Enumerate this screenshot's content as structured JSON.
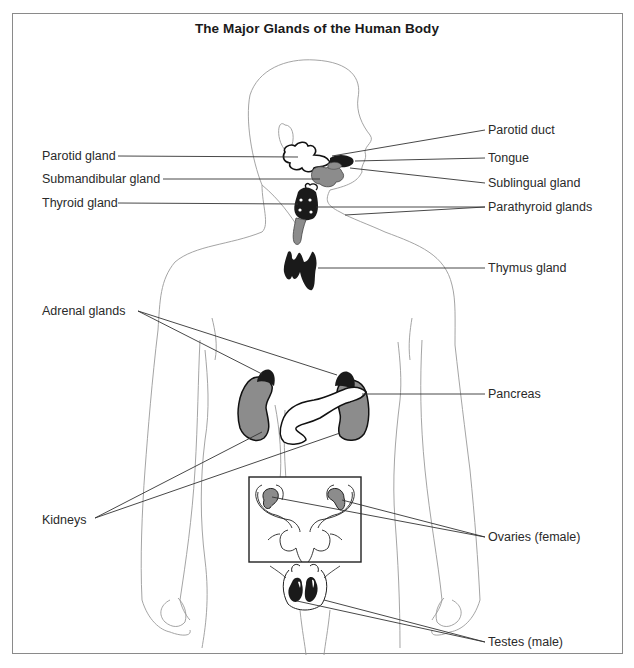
{
  "title": "The Major Glands of the Human Body",
  "labels": {
    "left": [
      {
        "id": "parotid-gland",
        "text": "Parotid gland",
        "x": 42,
        "y": 149
      },
      {
        "id": "submandibular-gland",
        "text": "Submandibular gland",
        "x": 42,
        "y": 172
      },
      {
        "id": "thyroid-gland",
        "text": "Thyroid gland",
        "x": 42,
        "y": 196
      },
      {
        "id": "adrenal-glands",
        "text": "Adrenal glands",
        "x": 42,
        "y": 304
      },
      {
        "id": "kidneys",
        "text": "Kidneys",
        "x": 42,
        "y": 513
      }
    ],
    "right": [
      {
        "id": "parotid-duct",
        "text": "Parotid duct",
        "x": 488,
        "y": 123
      },
      {
        "id": "tongue",
        "text": "Tongue",
        "x": 488,
        "y": 151
      },
      {
        "id": "sublingual-gland",
        "text": "Sublingual gland",
        "x": 488,
        "y": 176
      },
      {
        "id": "parathyroid-glands",
        "text": "Parathyroid glands",
        "x": 488,
        "y": 200
      },
      {
        "id": "thymus-gland",
        "text": "Thymus gland",
        "x": 488,
        "y": 261
      },
      {
        "id": "pancreas",
        "text": "Pancreas",
        "x": 488,
        "y": 387
      },
      {
        "id": "ovaries",
        "text": "Ovaries (female)",
        "x": 488,
        "y": 530
      },
      {
        "id": "testes",
        "text": "Testes (male)",
        "x": 488,
        "y": 635
      }
    ]
  },
  "colors": {
    "outline": "#9a9a9a",
    "organ_gray": "#8c8c8c",
    "organ_black": "#1a1a1a",
    "leader_line": "#333333",
    "frame": "#8a8a8a"
  }
}
